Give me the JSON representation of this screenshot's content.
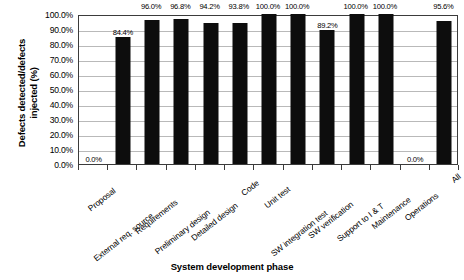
{
  "chart_data": {
    "type": "bar",
    "title": "",
    "xlabel": "System development phase",
    "ylabel_line1": "Defects detected/defects",
    "ylabel_line2": "injected (%)",
    "ylabel": "Defects detected/defects injected (%)",
    "ylim": [
      0,
      100
    ],
    "grid": true,
    "legend": "none",
    "orientation": "vertical",
    "bar_color": "#0d0d0d",
    "categories": [
      "Proposal",
      "External req. source",
      "Requirements",
      "Preliminary design",
      "Detailed design",
      "Code",
      "Unit test",
      "SW integration test",
      "SW verification",
      "Support to I & T",
      "Maintenance",
      "Operations",
      "All"
    ],
    "values": [
      0.0,
      84.4,
      96.0,
      96.8,
      94.2,
      93.8,
      100.0,
      100.0,
      89.2,
      100.0,
      100.0,
      0.0,
      95.6
    ],
    "data_labels": [
      "0.0%",
      "84.4%",
      "96.0%",
      "96.8%",
      "94.2%",
      "93.8%",
      "100.0%",
      "100.0%",
      "89.2%",
      "100.0%",
      "100.0%",
      "0.0%",
      "95.6%"
    ],
    "ytick_labels": [
      "100.0%",
      "90.0%",
      "80.0%",
      "70.0%",
      "60.0%",
      "50.0%",
      "40.0%",
      "30.0%",
      "20.0%",
      "10.0%",
      "0.0%"
    ],
    "ytick_values": [
      100,
      90,
      80,
      70,
      60,
      50,
      40,
      30,
      20,
      10,
      0
    ]
  }
}
